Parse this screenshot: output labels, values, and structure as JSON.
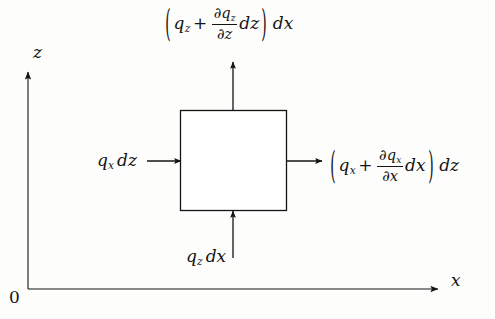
{
  "figure": {
    "type": "control-volume-heat-flux-diagram",
    "background_color": "#fdfdfc",
    "ink_color": "#141414"
  },
  "axes": {
    "vertical": {
      "label": "z",
      "name": "z-axis"
    },
    "horizontal": {
      "label": "x",
      "name": "x-axis"
    },
    "origin": {
      "label": "0"
    }
  },
  "control_volume": {
    "name": "differential-element",
    "shape": "square"
  },
  "fluxes": {
    "top": {
      "name": "outgoing-vertical-flux",
      "open_paren": "(",
      "base": "q",
      "base_sub": "z",
      "plus": "+",
      "frac_num_partial": "∂",
      "frac_num_var": "q",
      "frac_num_sub": "z",
      "frac_den_partial": "∂",
      "frac_den_var": "z",
      "differential_inner": "dz",
      "close_paren": ")",
      "differential_outer": "dx",
      "plain": "(q_z + (∂q_z/∂z) dz) dx"
    },
    "right": {
      "name": "outgoing-horizontal-flux",
      "open_paren": "(",
      "base": "q",
      "base_sub": "x",
      "plus": "+",
      "frac_num_partial": "∂",
      "frac_num_var": "q",
      "frac_num_sub": "x",
      "frac_den_partial": "∂",
      "frac_den_var": "x",
      "differential_inner": "dx",
      "close_paren": ")",
      "differential_outer": "dz",
      "plain": "(q_x + (∂q_x/∂x) dx) dz"
    },
    "left": {
      "name": "incoming-horizontal-flux",
      "base": "q",
      "base_sub": "x",
      "differential": "dz",
      "plain": "q_x dz"
    },
    "bottom": {
      "name": "incoming-vertical-flux",
      "base": "q",
      "base_sub": "z",
      "differential": "dx",
      "plain": "q_z dx"
    }
  }
}
